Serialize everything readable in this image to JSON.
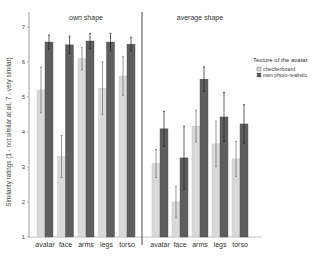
{
  "chart_data": {
    "type": "bar",
    "ylabel": "Similarity ratings (1 - not similar at all, 7 - very similar)",
    "xlabel": "",
    "ylim": [
      1,
      7
    ],
    "yticks": [
      1,
      2,
      3,
      4,
      5,
      6,
      7
    ],
    "categories": [
      "avatar",
      "face",
      "arms",
      "legs",
      "torso"
    ],
    "legend": {
      "title": "Texture of the avatar",
      "position": "right",
      "entries": [
        {
          "name": "checkerboard",
          "color": "#d9d9d9"
        },
        {
          "name": "own photo-realistic",
          "color": "#5e5e5e"
        }
      ]
    },
    "panels": [
      {
        "title": "own shape",
        "series": [
          {
            "name": "checkerboard",
            "values": [
              5.2,
              3.3,
              6.1,
              5.25,
              5.6
            ],
            "errors": [
              0.65,
              0.6,
              0.32,
              0.75,
              0.55
            ]
          },
          {
            "name": "own photo-realistic",
            "values": [
              6.57,
              6.49,
              6.6,
              6.57,
              6.51
            ],
            "errors": [
              0.2,
              0.25,
              0.22,
              0.25,
              0.2
            ]
          }
        ]
      },
      {
        "title": "average shape",
        "series": [
          {
            "name": "checkerboard",
            "values": [
              3.1,
              2.0,
              4.17,
              3.66,
              3.23
            ],
            "errors": [
              0.4,
              0.45,
              0.45,
              0.65,
              0.5
            ]
          },
          {
            "name": "own photo-realistic",
            "values": [
              4.09,
              3.26,
              5.51,
              4.43,
              4.23
            ],
            "errors": [
              0.5,
              0.9,
              0.35,
              0.7,
              0.55
            ]
          }
        ]
      }
    ],
    "grid": false
  }
}
